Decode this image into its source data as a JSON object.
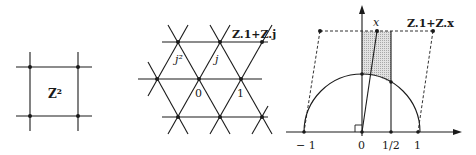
{
  "figure": {
    "panels": [
      {
        "id": "square-lattice",
        "label": "Z²"
      },
      {
        "id": "triangular-lattice",
        "labels": {
          "j2": "j²",
          "j": "j",
          "zero": "0",
          "one": "1",
          "lattice": "Z.1+Z.j"
        }
      },
      {
        "id": "fundamental-domain",
        "labels": {
          "x": "x",
          "lattice": "Z.1+Z.x",
          "minus_one": "− 1",
          "zero": "0",
          "half": "1/2",
          "one": "1"
        }
      }
    ],
    "colors": {
      "ink": "#1a1a1a",
      "shade": "#d4d4d4",
      "background": "#ffffff"
    }
  }
}
